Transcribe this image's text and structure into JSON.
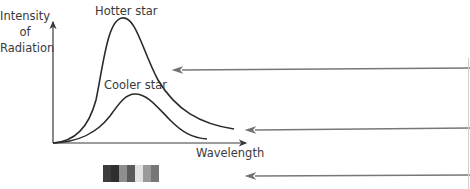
{
  "diagram": {
    "y_axis_label": "Intensity\nof\nRadiation",
    "x_axis_label": "Wavelength",
    "curves": [
      {
        "name": "hotter",
        "label": "Hotter star",
        "color": "#2b2b2b"
      },
      {
        "name": "cooler",
        "label": "Cooler star",
        "color": "#2b2b2b"
      }
    ],
    "spectrum_blocks": [
      "#3c3c3c",
      "#2e2e2e",
      "#8e8e8e",
      "#5a5a5a",
      "#e2e2e2",
      "#9a9a9a",
      "#777777",
      "#ffffff"
    ],
    "pointer_arrows": [
      {
        "name": "arrow-to-gap",
        "color": "#777777"
      },
      {
        "name": "arrow-to-curves",
        "color": "#777777"
      },
      {
        "name": "arrow-to-spectrum",
        "color": "#777777"
      }
    ]
  }
}
